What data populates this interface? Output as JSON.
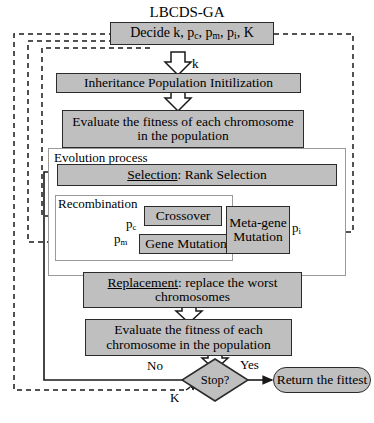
{
  "diagram": {
    "title": "LBCDS-GA",
    "nodes": {
      "decide": "Decide k, p<sub>c</sub>, p<sub>m</sub>, p<sub>i</sub>, K",
      "init": "Inheritance Population Initilization",
      "evaluate1_line1": "Evaluate the fitness of each chromosome",
      "evaluate1_line2": "in the population",
      "evolution_group": "Evolution process",
      "selection": "<u>Selection</u>: Rank Selection",
      "recombination_group": "Recombination",
      "crossover": "Crossover",
      "gene_mutation": "Gene Mutation",
      "meta_gene_line1": "Meta-gene",
      "meta_gene_line2": "Mutation",
      "replacement_line1": "<u>Replacement</u>: replace the worst",
      "replacement_line2": "chromosomes",
      "evaluate2_line1": "Evaluate the fitness of each",
      "evaluate2_line2": "chromosome in the population",
      "stop": "Stop?",
      "return": "Return the fittest"
    },
    "edge_labels": {
      "k_top": "k",
      "pc": "p<sub>c</sub>",
      "pm": "p<sub>m</sub>",
      "pi": "p<sub>i</sub>",
      "no": "No",
      "yes": "Yes",
      "k_bottom": "K"
    },
    "colors": {
      "fill_gray": "#bfbfbf",
      "stroke_dark": "#2b2b2b",
      "stroke_light": "#9a9a9a",
      "background": "#ffffff"
    }
  }
}
